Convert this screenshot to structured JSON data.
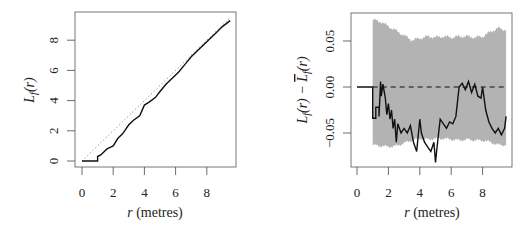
{
  "chart_data": [
    {
      "type": "line",
      "panel": "left",
      "title": "",
      "xlabel": "r (metres)",
      "ylabel": "L_f(r)",
      "xlim": [
        0,
        9.5
      ],
      "ylim": [
        0,
        9.3
      ],
      "xticks": [
        "0",
        "2",
        "4",
        "6",
        "8"
      ],
      "yticks": [
        "0",
        "2",
        "4",
        "6",
        "8"
      ],
      "grid": false,
      "series": [
        {
          "name": "L_f(r) (observed)",
          "style": "solid black",
          "x": [
            0,
            1.0,
            1.0,
            1.2,
            1.4,
            1.6,
            1.8,
            2.0,
            2.3,
            2.6,
            3.0,
            3.3,
            3.7,
            4.0,
            4.3,
            4.7,
            5.0,
            5.4,
            5.8,
            6.2,
            6.6,
            7.0,
            7.4,
            7.8,
            8.2,
            8.6,
            9.0,
            9.5
          ],
          "y": [
            0,
            0,
            0.3,
            0.4,
            0.6,
            0.8,
            0.9,
            1.0,
            1.5,
            1.8,
            2.4,
            2.7,
            3.0,
            3.7,
            3.9,
            4.2,
            4.6,
            5.1,
            5.5,
            5.9,
            6.4,
            6.9,
            7.3,
            7.7,
            8.1,
            8.5,
            8.9,
            9.3
          ]
        },
        {
          "name": "theoretical L(r) = r",
          "style": "dotted grey",
          "x": [
            0,
            9.5
          ],
          "y": [
            0,
            9.5
          ]
        }
      ]
    },
    {
      "type": "line",
      "panel": "right",
      "title": "",
      "xlabel": "r (metres)",
      "ylabel": "L_f(r) − L̄_f(r)",
      "xlim": [
        0,
        9.5
      ],
      "ylim": [
        -0.085,
        0.075
      ],
      "xticks": [
        "0",
        "2",
        "4",
        "6",
        "8"
      ],
      "yticks": [
        "-0.05",
        "0.00",
        "0.05"
      ],
      "grid": false,
      "series": [
        {
          "name": "L_f(r) - mean L_f(r)",
          "style": "solid black",
          "x": [
            0,
            1.0,
            1.0,
            1.2,
            1.2,
            1.4,
            1.4,
            1.5,
            1.55,
            1.65,
            1.8,
            1.9,
            2.0,
            2.1,
            2.2,
            2.3,
            2.4,
            2.5,
            2.6,
            2.8,
            3.0,
            3.2,
            3.4,
            3.6,
            3.8,
            4.0,
            4.1,
            4.3,
            4.5,
            4.7,
            4.9,
            5.0,
            5.1,
            5.3,
            5.5,
            5.7,
            5.9,
            6.1,
            6.3,
            6.5,
            6.7,
            6.9,
            7.1,
            7.3,
            7.5,
            7.7,
            7.9,
            8.0,
            8.2,
            8.4,
            8.6,
            8.8,
            9.0,
            9.2,
            9.4,
            9.5
          ],
          "y": [
            0,
            0,
            -0.034,
            -0.034,
            -0.022,
            -0.022,
            -0.032,
            0.006,
            -0.01,
            0.003,
            -0.012,
            -0.03,
            -0.018,
            -0.035,
            -0.025,
            -0.045,
            -0.035,
            -0.06,
            -0.04,
            -0.05,
            -0.045,
            -0.05,
            -0.042,
            -0.06,
            -0.07,
            -0.035,
            -0.05,
            -0.06,
            -0.065,
            -0.07,
            -0.06,
            -0.082,
            -0.065,
            -0.035,
            -0.04,
            -0.045,
            -0.038,
            -0.04,
            -0.032,
            0.0,
            0.004,
            -0.003,
            0.006,
            -0.006,
            0.003,
            -0.01,
            -0.012,
            0.0,
            -0.025,
            -0.038,
            -0.045,
            -0.05,
            -0.045,
            -0.052,
            -0.045,
            -0.032
          ]
        },
        {
          "name": "zero reference",
          "style": "dashed black",
          "x": [
            1.0,
            9.5
          ],
          "y": [
            0,
            0
          ]
        },
        {
          "name": "simulation envelope",
          "style": "grey band",
          "x": [
            1.0,
            1.5,
            2.0,
            2.5,
            3.0,
            3.5,
            4.0,
            4.5,
            5.0,
            5.5,
            6.0,
            6.5,
            7.0,
            7.5,
            8.0,
            8.5,
            9.0,
            9.5
          ],
          "upper": [
            0.073,
            0.071,
            0.066,
            0.061,
            0.056,
            0.051,
            0.053,
            0.055,
            0.054,
            0.055,
            0.054,
            0.055,
            0.055,
            0.054,
            0.055,
            0.06,
            0.064,
            0.062
          ],
          "lower": [
            -0.063,
            -0.064,
            -0.065,
            -0.064,
            -0.061,
            -0.058,
            -0.056,
            -0.057,
            -0.056,
            -0.056,
            -0.057,
            -0.058,
            -0.057,
            -0.058,
            -0.058,
            -0.06,
            -0.063,
            -0.063
          ]
        }
      ]
    }
  ],
  "labels": {
    "left_ylabel_main": "L",
    "left_ylabel_sub": "f",
    "left_ylabel_arg": "(r)",
    "right_ylabel_main1": "L",
    "right_ylabel_sub1": "f",
    "right_ylabel_arg1": "(r) − ",
    "right_ylabel_main2": "L",
    "right_ylabel_sub2": "f",
    "right_ylabel_arg2": "(r)",
    "xlabel_r": "r",
    "xlabel_units": " (metres)"
  }
}
